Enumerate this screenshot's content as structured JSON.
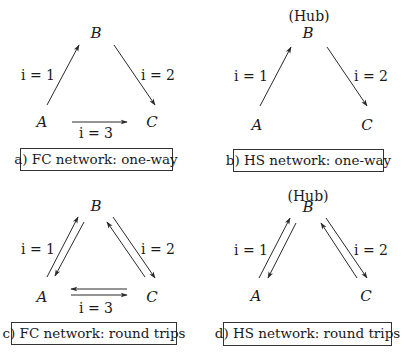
{
  "figure": {
    "panels": [
      {
        "id": "a",
        "caption": "a) FC network: one-way",
        "hub_label": "",
        "nodes": {
          "A": "A",
          "B": "B",
          "C": "C"
        },
        "edge_labels": {
          "e1": "i = 1",
          "e2": "i = 2",
          "e3": "i = 3"
        },
        "type": "fully-connected",
        "direction": "one-way"
      },
      {
        "id": "b",
        "caption": "b) HS network: one-way",
        "hub_label": "(Hub)",
        "nodes": {
          "A": "A",
          "B": "B",
          "C": "C"
        },
        "edge_labels": {
          "e1": "i = 1",
          "e2": "i = 2"
        },
        "type": "hub-and-spoke",
        "direction": "one-way"
      },
      {
        "id": "c",
        "caption": "c) FC network: round trips",
        "hub_label": "",
        "nodes": {
          "A": "A",
          "B": "B",
          "C": "C"
        },
        "edge_labels": {
          "e1": "i = 1",
          "e2": "i = 2",
          "e3": "i = 3"
        },
        "type": "fully-connected",
        "direction": "round trips"
      },
      {
        "id": "d",
        "caption": "d) HS network: round trips",
        "hub_label": "(Hub)",
        "nodes": {
          "A": "A",
          "B": "B",
          "C": "C"
        },
        "edge_labels": {
          "e1": "i = 1",
          "e2": "i = 2"
        },
        "type": "hub-and-spoke",
        "direction": "round trips"
      }
    ],
    "colors": {
      "ink": "#1a1a1a",
      "background": "#ffffff",
      "box_border": "#333333"
    }
  }
}
